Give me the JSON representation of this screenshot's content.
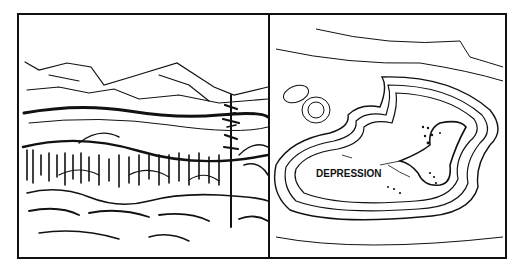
{
  "figure": {
    "left_panel": {
      "description": "Sketch of terrain: mountains, forest, a tall pine tree, and a low basin area"
    },
    "right_panel": {
      "description": "Contour map symbol representation of a depression",
      "label": "DEPRESSION"
    },
    "colors": {
      "ink": "#111111",
      "background": "#ffffff"
    }
  }
}
